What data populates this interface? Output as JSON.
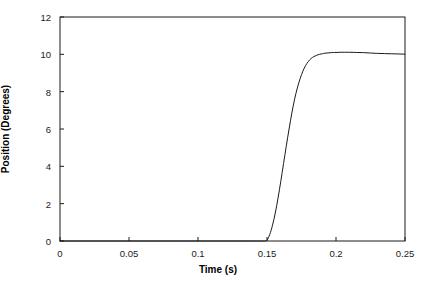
{
  "chart_data": {
    "type": "line",
    "title": "",
    "xlabel": "Time (s)",
    "ylabel": "Position (Degrees)",
    "xlim": [
      0,
      0.25
    ],
    "ylim": [
      0,
      12
    ],
    "grid": false,
    "legend": null,
    "xticks": [
      0,
      0.05,
      0.1,
      0.15,
      0.2,
      0.25
    ],
    "xtick_labels": [
      "0",
      "0.05",
      "0.1",
      "0.15",
      "0.2",
      "0.25"
    ],
    "yticks": [
      0,
      2,
      4,
      6,
      8,
      10,
      12
    ],
    "ytick_labels": [
      "0",
      "2",
      "4",
      "6",
      "8",
      "10",
      "12"
    ],
    "line_color": "#1a1a1a",
    "line_width": 1,
    "frame_color": "#1a1a1a",
    "background": "#ffffff",
    "series": [
      {
        "name": "Position response",
        "x": [
          0,
          0.01,
          0.02,
          0.03,
          0.04,
          0.05,
          0.06,
          0.07,
          0.08,
          0.09,
          0.1,
          0.11,
          0.12,
          0.13,
          0.14,
          0.145,
          0.148,
          0.15,
          0.152,
          0.154,
          0.156,
          0.158,
          0.16,
          0.162,
          0.164,
          0.166,
          0.168,
          0.17,
          0.172,
          0.174,
          0.176,
          0.178,
          0.18,
          0.182,
          0.184,
          0.186,
          0.188,
          0.19,
          0.192,
          0.195,
          0.198,
          0.2,
          0.203,
          0.206,
          0.21,
          0.215,
          0.22,
          0.225,
          0.23,
          0.235,
          0.24,
          0.245,
          0.25
        ],
        "y": [
          0,
          0,
          0,
          0,
          0,
          0,
          0,
          0,
          0,
          0,
          0,
          0,
          0,
          0,
          0,
          0,
          0,
          0.05,
          0.35,
          0.85,
          1.5,
          2.3,
          3.2,
          4.15,
          5.1,
          6.0,
          6.85,
          7.6,
          8.2,
          8.7,
          9.1,
          9.4,
          9.62,
          9.78,
          9.88,
          9.95,
          10.0,
          10.03,
          10.06,
          10.08,
          10.1,
          10.1,
          10.11,
          10.11,
          10.11,
          10.1,
          10.09,
          10.07,
          10.05,
          10.04,
          10.03,
          10.02,
          10.01
        ]
      }
    ]
  }
}
